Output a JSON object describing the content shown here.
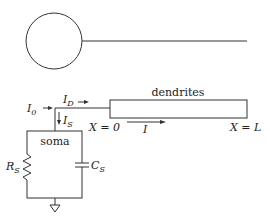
{
  "diagram": {
    "top_model": {
      "soma_shape": "circle",
      "dendrite_shape": "line"
    },
    "labels": {
      "dendrites": "dendrites",
      "soma": "soma",
      "I0_main": "I",
      "I0_sub": "0",
      "ID_main": "I",
      "ID_sub": "D",
      "IS_main": "I",
      "IS_sub": "S",
      "I_dendrite": "I",
      "X0": "X = 0",
      "XL": "X = L",
      "RS_main": "R",
      "RS_sub": "S",
      "CS_main": "C",
      "CS_sub": "S"
    },
    "components": [
      {
        "type": "resistor",
        "name": "R_S"
      },
      {
        "type": "capacitor",
        "name": "C_S"
      },
      {
        "type": "ground"
      }
    ],
    "colors": {
      "line": "#333333",
      "background": "#ffffff"
    }
  }
}
